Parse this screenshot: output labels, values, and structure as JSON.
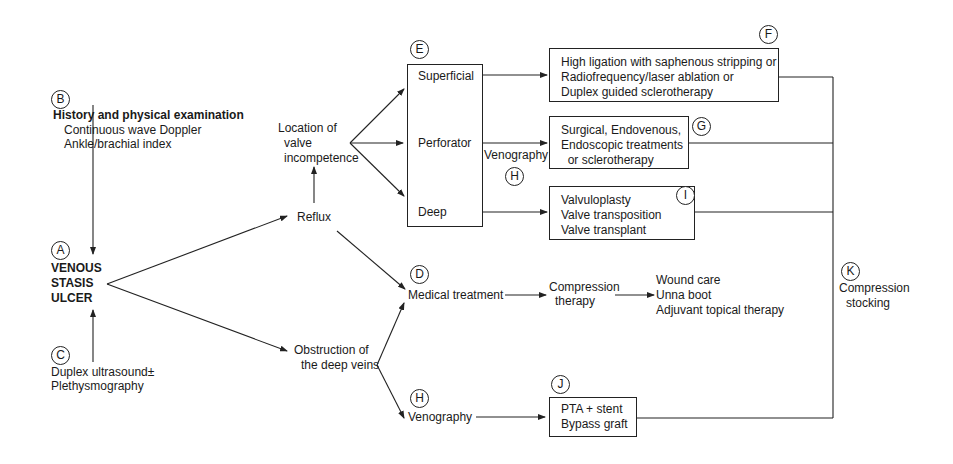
{
  "diagram": {
    "type": "clinical-algorithm-flowchart",
    "markers": {
      "A": "A",
      "B": "B",
      "C": "C",
      "D": "D",
      "E": "E",
      "F": "F",
      "G": "G",
      "H1": "H",
      "H2": "H",
      "I": "I",
      "J": "J",
      "K": "K"
    },
    "nodes": {
      "history": {
        "title": "History and physical examination",
        "lines": [
          "Continuous wave Doppler",
          "Ankle/brachial index"
        ]
      },
      "ulcer": {
        "lines": [
          "VENOUS",
          "STASIS",
          "ULCER"
        ]
      },
      "duplex": {
        "lines": [
          "Duplex ultrasound±",
          "Plethysmography"
        ]
      },
      "reflux": {
        "label": "Reflux"
      },
      "location": {
        "lines": [
          "Location of",
          "valve",
          "incompetence"
        ]
      },
      "valve_box": {
        "superficial": "Superficial",
        "perforator": "Perforator",
        "deep": "Deep"
      },
      "superficial_tx": {
        "lines": [
          "High ligation with saphenous stripping or",
          "Radiofrequency/laser ablation or",
          "Duplex guided sclerotherapy"
        ]
      },
      "perforator_tx": {
        "lines": [
          "Surgical, Endovenous,",
          "Endoscopic treatments",
          "  or sclerotherapy"
        ]
      },
      "venography_upper": {
        "label": "Venography"
      },
      "deep_tx": {
        "lines": [
          "Valvuloplasty",
          "Valve transposition",
          "Valve transplant"
        ]
      },
      "medical": {
        "label": "Medical treatment"
      },
      "compression_therapy": {
        "lines": [
          "Compression",
          "therapy"
        ]
      },
      "wound": {
        "lines": [
          "Wound care",
          "Unna boot",
          "Adjuvant topical therapy"
        ]
      },
      "obstruction": {
        "lines": [
          "Obstruction of",
          "the deep veins"
        ]
      },
      "venography_lower": {
        "label": "Venography"
      },
      "pta": {
        "lines": [
          "PTA + stent",
          "Bypass graft"
        ]
      },
      "stocking": {
        "lines": [
          "Compression",
          "stocking"
        ]
      }
    },
    "edges": [
      [
        "history",
        "ulcer"
      ],
      [
        "duplex",
        "ulcer"
      ],
      [
        "ulcer",
        "reflux"
      ],
      [
        "ulcer",
        "obstruction"
      ],
      [
        "reflux",
        "location"
      ],
      [
        "reflux",
        "medical"
      ],
      [
        "location",
        "superficial"
      ],
      [
        "location",
        "perforator"
      ],
      [
        "location",
        "deep"
      ],
      [
        "superficial",
        "superficial_tx"
      ],
      [
        "perforator",
        "perforator_tx"
      ],
      [
        "deep",
        "deep_tx"
      ],
      [
        "medical",
        "compression_therapy"
      ],
      [
        "compression_therapy",
        "wound"
      ],
      [
        "obstruction",
        "medical"
      ],
      [
        "obstruction",
        "venography_lower"
      ],
      [
        "venography_lower",
        "pta"
      ],
      [
        "superficial_tx",
        "stocking"
      ],
      [
        "perforator_tx",
        "stocking"
      ],
      [
        "deep_tx",
        "stocking"
      ],
      [
        "pta",
        "stocking"
      ]
    ]
  },
  "colors": {
    "line": "#222222",
    "text": "#1a1a1a",
    "background": "#ffffff"
  }
}
